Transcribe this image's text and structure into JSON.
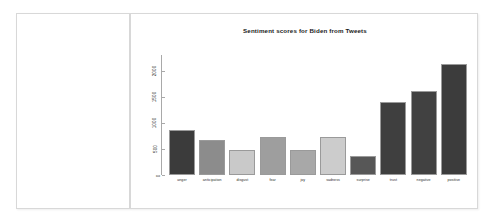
{
  "document": {
    "left_panel": {
      "content": ""
    }
  },
  "chart_data": {
    "type": "bar",
    "title": "Sentiment scores for Biden from Tweets",
    "xlabel": "",
    "ylabel": "",
    "categories": [
      "anger",
      "anticipation",
      "disgust",
      "fear",
      "joy",
      "sadness",
      "surprise",
      "trust",
      "negative",
      "positive"
    ],
    "values": [
      860,
      672,
      472,
      722,
      472,
      722,
      363,
      1405,
      1610,
      2127
    ],
    "bar_colors": [
      "#3b3b3b",
      "#8c8c8c",
      "#c9c9c9",
      "#9e9e9e",
      "#a8a8a8",
      "#cccccc",
      "#575757",
      "#3f3f3f",
      "#414141",
      "#3c3c3c"
    ],
    "ylim": [
      0,
      2300
    ],
    "yticks": [
      0,
      500,
      1000,
      1500,
      2000
    ],
    "ytick_labels": [
      "0",
      "500",
      "1000",
      "1500",
      "2000"
    ],
    "grid": false,
    "legend": "none"
  }
}
